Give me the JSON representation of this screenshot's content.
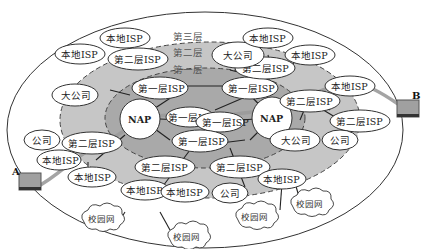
{
  "diagram": {
    "title": "",
    "layers": {
      "tier3": "第三层",
      "tier2": "第二层",
      "tier1": "第一层"
    },
    "colors": {
      "tier3_fill": "#ffffff",
      "tier2_fill": "#c8c8c8",
      "tier1_fill": "#a8a8a8",
      "node_fill": "#ffffff",
      "stroke": "#333333",
      "path": "#9a9a9a"
    },
    "nodes": {
      "local_isp_1": "本地ISP",
      "local_isp_2": "本地ISP",
      "local_isp_3": "本地ISP",
      "local_isp_4": "本地ISP",
      "local_isp_5": "本地ISP",
      "local_isp_6": "本地ISP",
      "local_isp_7": "本地ISP",
      "local_isp_8": "本地ISP",
      "local_isp_9": "本地ISP",
      "tier2_isp_1": "第二层ISP",
      "tier2_isp_2": "第二层ISP",
      "tier2_isp_3": "第二层ISP",
      "tier2_isp_4": "第二层ISP",
      "tier2_isp_5": "第二层ISP",
      "tier2_isp_6": "第二层ISP",
      "tier2_isp_7": "第二层ISP",
      "tier2_isp_8": "第二层ISP",
      "tier1_isp_1": "第一层ISP",
      "tier1_isp_2": "第一层ISP",
      "tier1_isp_3": "第一层ISP",
      "tier1_isp_4": "第一层ISP",
      "tier1_isp_5": "第一层ISP",
      "nap_left": "NAP",
      "nap_right": "NAP",
      "big_company_1": "大公司",
      "big_company_2": "大公司",
      "big_company_3": "大公司",
      "company_1": "公司",
      "company_2": "公司",
      "company_3": "公司",
      "company_4": "公司"
    },
    "clouds": {
      "campus_1": "校园网",
      "campus_2": "校园网",
      "campus_3": "校园网",
      "campus_4": "校园网"
    },
    "endpoints": {
      "a": "A",
      "b": "B"
    }
  }
}
